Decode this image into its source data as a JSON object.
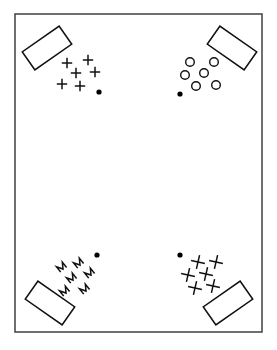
{
  "figure": {
    "title": "Four-corner mark clusters with rotated blocks",
    "background_color": "#ffffff",
    "ink_color": "#111111",
    "frame": {
      "label": "page-border",
      "stroke_color": "#4b4b4b",
      "x": 15,
      "y": 14,
      "width": 247,
      "height": 318
    }
  },
  "quadrants": [
    {
      "id": "top-left",
      "label": "Top left cluster",
      "mark_glyph": "plus-cross",
      "mark_count": 6,
      "block": {
        "label": "rotated-block",
        "cx": 47,
        "cy": 48,
        "width": 45,
        "height": 22,
        "rotation_deg": -35
      },
      "marks": [
        {
          "x": 67,
          "y": 63
        },
        {
          "x": 88,
          "y": 60
        },
        {
          "x": 76,
          "y": 73
        },
        {
          "x": 95,
          "y": 72
        },
        {
          "x": 62,
          "y": 84
        },
        {
          "x": 80,
          "y": 86
        }
      ],
      "dot": {
        "x": 99,
        "y": 92,
        "r": 2.6
      }
    },
    {
      "id": "top-right",
      "label": "Top right cluster",
      "mark_glyph": "open-circle",
      "mark_count": 6,
      "block": {
        "label": "rotated-block",
        "cx": 232,
        "cy": 48,
        "width": 45,
        "height": 22,
        "rotation_deg": 35
      },
      "marks": [
        {
          "x": 190,
          "y": 62
        },
        {
          "x": 214,
          "y": 62
        },
        {
          "x": 185,
          "y": 75
        },
        {
          "x": 204,
          "y": 73
        },
        {
          "x": 196,
          "y": 86
        },
        {
          "x": 216,
          "y": 85
        }
      ],
      "dot": {
        "x": 180,
        "y": 94,
        "r": 2.6
      }
    },
    {
      "id": "bottom-left",
      "label": "Bottom left cluster",
      "mark_glyph": "zigzag-m",
      "mark_count": 6,
      "block": {
        "label": "rotated-block",
        "cx": 50,
        "cy": 303,
        "width": 45,
        "height": 22,
        "rotation_deg": 35
      },
      "marks": [
        {
          "x": 63,
          "y": 266
        },
        {
          "x": 80,
          "y": 262
        },
        {
          "x": 73,
          "y": 277
        },
        {
          "x": 91,
          "y": 272
        },
        {
          "x": 66,
          "y": 290
        },
        {
          "x": 86,
          "y": 288
        }
      ],
      "dot": {
        "x": 97,
        "y": 255,
        "r": 2.6
      }
    },
    {
      "id": "bottom-right",
      "label": "Bottom right cluster",
      "mark_glyph": "rotated-x",
      "mark_count": 6,
      "block": {
        "label": "rotated-block",
        "cx": 228,
        "cy": 303,
        "width": 45,
        "height": 22,
        "rotation_deg": -35
      },
      "marks": [
        {
          "x": 198,
          "y": 262
        },
        {
          "x": 216,
          "y": 262
        },
        {
          "x": 188,
          "y": 275
        },
        {
          "x": 206,
          "y": 274
        },
        {
          "x": 195,
          "y": 288
        },
        {
          "x": 213,
          "y": 286
        }
      ],
      "dot": {
        "x": 180,
        "y": 255,
        "r": 2.6
      }
    }
  ]
}
